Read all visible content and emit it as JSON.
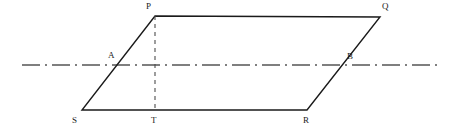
{
  "figure": {
    "type": "geometry-diagram",
    "canvas": {
      "width": 463,
      "height": 131,
      "background": "#ffffff"
    },
    "colors": {
      "stroke": "#1a1a1a",
      "axis": "#555555",
      "dashed_altitude": "#4d4d4d",
      "label": "#1a1a1a",
      "background": "#ffffff"
    },
    "points": [
      {
        "name": "P",
        "label": "P",
        "x": 155,
        "y": 16,
        "label_x": 146,
        "label_y": 2
      },
      {
        "name": "Q",
        "label": "Q",
        "x": 380,
        "y": 17,
        "label_x": 382,
        "label_y": 2
      },
      {
        "name": "R",
        "label": "R",
        "x": 307,
        "y": 110,
        "label_x": 303,
        "label_y": 116
      },
      {
        "name": "S",
        "label": "S",
        "x": 82,
        "y": 110,
        "label_x": 72,
        "label_y": 116
      },
      {
        "name": "T",
        "label": "T",
        "x": 155,
        "y": 110,
        "label_x": 151,
        "label_y": 116
      },
      {
        "name": "A",
        "label": "A",
        "x": 119,
        "y": 65,
        "label_x": 108,
        "label_y": 51
      },
      {
        "name": "B",
        "label": "B",
        "x": 344,
        "y": 65,
        "label_x": 347,
        "label_y": 52
      }
    ],
    "shapes": {
      "parallelogram": {
        "name": "parallelogram-PQRS",
        "vertices": "P,Q,R,S",
        "stroke_width": 1.4
      },
      "altitude": {
        "name": "altitude-PT",
        "from": "P",
        "to": "T",
        "style": "dashed",
        "dash": "4 4",
        "stroke_width": 1.1
      },
      "axis": {
        "name": "axis-of-symmetry",
        "style": "dash-dot",
        "dash": "18 5 2 5",
        "x_start": 22,
        "x_end": 441,
        "y": 65,
        "stroke_width": 1.4
      }
    }
  }
}
